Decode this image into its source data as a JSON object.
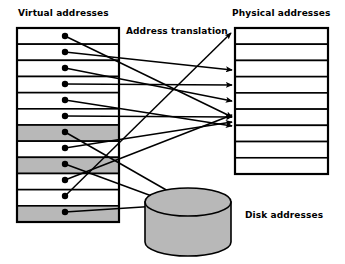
{
  "diagram": {
    "title_virtual": "Virtual addresses",
    "title_translation": "Address translation",
    "title_physical": "Physical addresses",
    "title_disk": "Disk addresses",
    "colors": {
      "stroke": "#000000",
      "shaded_row": "#b8b8b8",
      "empty_row": "#ffffff",
      "disk_fill": "#b8b8b8",
      "background": "#ffffff"
    },
    "virtual_table": {
      "x": 17,
      "y": 28,
      "width": 102,
      "height": 194,
      "row_count": 12,
      "rows": [
        {
          "index": 1,
          "shaded": false
        },
        {
          "index": 2,
          "shaded": false
        },
        {
          "index": 3,
          "shaded": false
        },
        {
          "index": 4,
          "shaded": false
        },
        {
          "index": 5,
          "shaded": false
        },
        {
          "index": 6,
          "shaded": false
        },
        {
          "index": 7,
          "shaded": true
        },
        {
          "index": 8,
          "shaded": false
        },
        {
          "index": 9,
          "shaded": true
        },
        {
          "index": 10,
          "shaded": false
        },
        {
          "index": 11,
          "shaded": false
        },
        {
          "index": 12,
          "shaded": true
        }
      ]
    },
    "physical_table": {
      "x": 235,
      "y": 28,
      "width": 93,
      "height": 146,
      "row_count": 9,
      "rows": [
        {
          "index": 1,
          "shaded": false
        },
        {
          "index": 2,
          "shaded": false
        },
        {
          "index": 3,
          "shaded": false
        },
        {
          "index": 4,
          "shaded": false
        },
        {
          "index": 5,
          "shaded": false
        },
        {
          "index": 6,
          "shaded": false
        },
        {
          "index": 7,
          "shaded": false
        },
        {
          "index": 8,
          "shaded": false
        },
        {
          "index": 9,
          "shaded": false
        }
      ]
    },
    "disk": {
      "cx": 188,
      "top_cy": 202,
      "rx": 43,
      "ry": 14,
      "body_height": 40
    },
    "source_dots": [
      {
        "row": 1,
        "x": 65,
        "y": 36
      },
      {
        "row": 2,
        "x": 65,
        "y": 52
      },
      {
        "row": 3,
        "x": 65,
        "y": 68
      },
      {
        "row": 4,
        "x": 65,
        "y": 84
      },
      {
        "row": 5,
        "x": 65,
        "y": 100
      },
      {
        "row": 6,
        "x": 65,
        "y": 116
      },
      {
        "row": 7,
        "x": 65,
        "y": 132
      },
      {
        "row": 8,
        "x": 65,
        "y": 148
      },
      {
        "row": 9,
        "x": 65,
        "y": 164
      },
      {
        "row": 10,
        "x": 65,
        "y": 180
      },
      {
        "row": 11,
        "x": 65,
        "y": 196
      },
      {
        "row": 12,
        "x": 65,
        "y": 212
      }
    ],
    "mappings": [
      {
        "from_row": 1,
        "to": "physical",
        "to_row": 6,
        "x1": 65,
        "y1": 36,
        "x2": 232,
        "y2": 117
      },
      {
        "from_row": 2,
        "to": "physical",
        "to_row": 2,
        "x1": 65,
        "y1": 52,
        "x2": 232,
        "y2": 70
      },
      {
        "from_row": 3,
        "to": "physical",
        "to_row": 4,
        "x1": 65,
        "y1": 68,
        "x2": 232,
        "y2": 101
      },
      {
        "from_row": 4,
        "to": "physical",
        "to_row": 3,
        "x1": 65,
        "y1": 84,
        "x2": 232,
        "y2": 85
      },
      {
        "from_row": 5,
        "to": "physical",
        "to_row": 7,
        "x1": 65,
        "y1": 100,
        "x2": 232,
        "y2": 126
      },
      {
        "from_row": 6,
        "to": "physical",
        "to_row": 5,
        "x1": 65,
        "y1": 116,
        "x2": 232,
        "y2": 117
      },
      {
        "from_row": 7,
        "to": "disk",
        "to_row": 0,
        "x1": 65,
        "y1": 132,
        "x2": 182,
        "y2": 199
      },
      {
        "from_row": 8,
        "to": "physical",
        "to_row": 6,
        "x1": 65,
        "y1": 148,
        "x2": 232,
        "y2": 122
      },
      {
        "from_row": 9,
        "to": "disk",
        "to_row": 0,
        "x1": 65,
        "y1": 164,
        "x2": 168,
        "y2": 202
      },
      {
        "from_row": 10,
        "to": "physical",
        "to_row": 5,
        "x1": 65,
        "y1": 180,
        "x2": 232,
        "y2": 115
      },
      {
        "from_row": 11,
        "to": "physical",
        "to_row": 1,
        "x1": 65,
        "y1": 196,
        "x2": 231,
        "y2": 33
      },
      {
        "from_row": 12,
        "to": "disk",
        "to_row": 0,
        "x1": 65,
        "y1": 212,
        "x2": 158,
        "y2": 206
      }
    ]
  }
}
